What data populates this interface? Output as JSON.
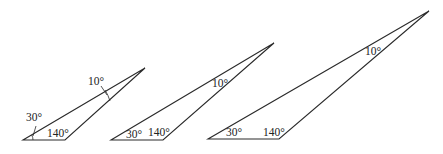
{
  "diagram": {
    "title": "",
    "triangles": [
      {
        "id": "triangle-1",
        "vertices": {
          "base_left": [
            23,
            140
          ],
          "base_right": [
            65,
            140
          ],
          "apex": [
            145,
            68
          ]
        },
        "angles": {
          "base_left": "30°",
          "base_right": "140°",
          "apex": "10°"
        },
        "label_positions": {
          "base_left": [
            26,
            120
          ],
          "base_right": [
            48,
            137
          ],
          "apex": [
            88,
            85
          ]
        },
        "has_angle_arcs": true
      },
      {
        "id": "triangle-2",
        "vertices": {
          "base_left": [
            111,
            140
          ],
          "base_right": [
            163,
            140
          ],
          "apex": [
            274,
            43
          ]
        },
        "angles": {
          "base_left": "30°",
          "base_right": "140°",
          "apex": "10°"
        },
        "label_positions": {
          "base_left": [
            126,
            138
          ],
          "base_right": [
            148,
            136
          ],
          "apex": [
            212,
            87
          ]
        },
        "has_angle_arcs": false
      },
      {
        "id": "triangle-3",
        "vertices": {
          "base_left": [
            208,
            139
          ],
          "base_right": [
            279,
            139
          ],
          "apex": [
            429,
            11
          ]
        },
        "angles": {
          "base_left": "30°",
          "base_right": "140°",
          "apex": "10°"
        },
        "label_positions": {
          "base_left": [
            226,
            136
          ],
          "base_right": [
            263,
            136
          ],
          "apex": [
            365,
            55
          ]
        },
        "has_angle_arcs": false
      }
    ]
  }
}
